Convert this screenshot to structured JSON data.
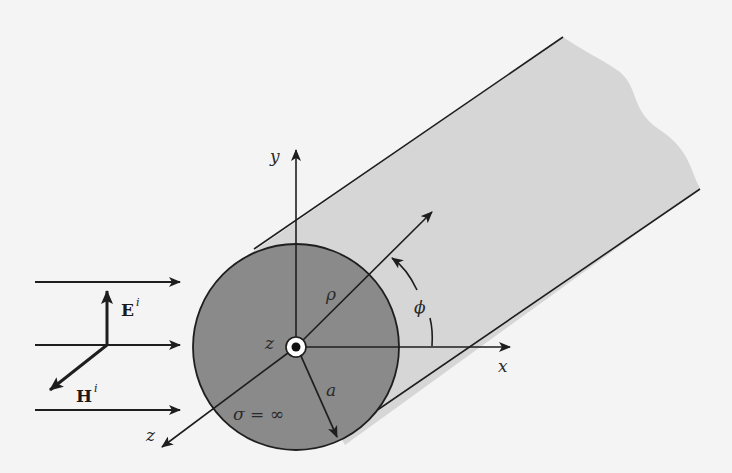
{
  "diagram": {
    "colors": {
      "background": "#f4f4f4",
      "cylinder_body": "#d6d6d6",
      "cross_section": "#8a8a8a",
      "lines": "#1e1e1e"
    },
    "incident_field": {
      "electric_label": "E",
      "electric_superscript": "i",
      "magnetic_label": "H",
      "magnetic_superscript": "i",
      "propagation_arrows": 3
    },
    "axes": {
      "x": "x",
      "y": "y",
      "z_near_origin": "z",
      "z_axis": "z"
    },
    "cylinder": {
      "radius_label": "a",
      "conductivity_label": "σ = ∞",
      "radial_label": "ρ",
      "angle_label": "ϕ"
    }
  }
}
